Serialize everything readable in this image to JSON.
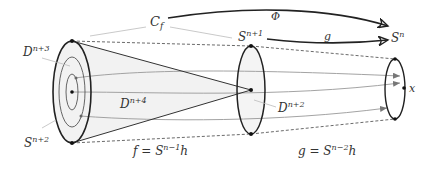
{
  "diagram": {
    "colors": {
      "background": "#ffffff",
      "stroke_dark": "#222222",
      "stroke_gray": "#888888",
      "leader_gray": "#bbbbbb",
      "fill_light": "#f0f0f0",
      "arrowhead_gray": "#777777"
    },
    "labels": {
      "cf": {
        "base": "C",
        "sub": "f"
      },
      "phi": "Φ",
      "g_arrow": "g",
      "s_n": {
        "base": "S",
        "sup": "n"
      },
      "s_n1": {
        "base": "S",
        "sup": "n+1"
      },
      "s_n2": {
        "base": "S",
        "sup": "n+2"
      },
      "d_n3": {
        "base": "D",
        "sup": "n+3"
      },
      "d_n4": {
        "base": "D",
        "sup": "n+4"
      },
      "d_n2": {
        "base": "D",
        "sup": "n+2"
      },
      "x": "x",
      "f_eq": {
        "lhs": "f = S",
        "sup": "n−1",
        "rhs": "h"
      },
      "g_eq": {
        "lhs": "g = S",
        "sup": "n−2",
        "rhs": "h"
      }
    },
    "shapes": {
      "left_ellipse": {
        "cx": 72,
        "cy": 92,
        "rx": 19,
        "ry": 51
      },
      "left_inner_1": {
        "cx": 72,
        "cy": 92,
        "rx": 13,
        "ry": 35
      },
      "left_inner_2": {
        "cx": 72,
        "cy": 92,
        "rx": 6,
        "ry": 18
      },
      "middle_ellipse": {
        "cx": 251,
        "cy": 90,
        "rx": 14,
        "ry": 44
      },
      "right_ellipse": {
        "cx": 395,
        "cy": 89,
        "rx": 10,
        "ry": 30
      },
      "cone_apex": {
        "x": 251,
        "y": 90
      }
    }
  }
}
